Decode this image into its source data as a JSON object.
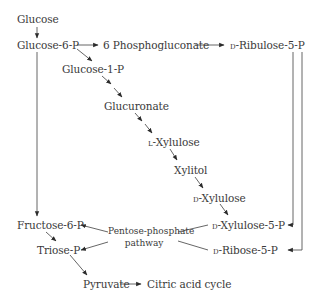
{
  "diagram": {
    "type": "metabolic-pathway",
    "colors": {
      "text": "#3a3a3a",
      "arrow": "#2b2b2b",
      "line": "#555555",
      "background": "#ffffff"
    },
    "nodes": {
      "glucose": "Glucose",
      "glucose_6_p": "Glucose-6-P",
      "phosphogluconate": "6 Phosphogluconate",
      "ribulose_5_p_prefix": "d",
      "ribulose_5_p": "-Ribulose-5-P",
      "glucose_1_p": "Glucose-1-P",
      "glucuronate": "Glucuronate",
      "l_xylulose_prefix": "l",
      "l_xylulose": "-Xylulose",
      "xylitol": "Xylitol",
      "d_xylulose_prefix": "d",
      "d_xylulose": "-Xylulose",
      "fructose_6_p": "Fructose-6-P",
      "xylulose_5_p_prefix": "d",
      "xylulose_5_p": "-Xylulose-5-P",
      "triose_p": "Triose-P",
      "ribose_5_p_prefix": "d",
      "ribose_5_p": "-Ribose-5-P",
      "pyruvate": "Pyruvate",
      "citric_acid_cycle": "Citric acid cycle"
    },
    "hub": {
      "line1": "Pentose-phosphate",
      "line2": "pathway"
    },
    "edges": [
      {
        "from": "Glucose",
        "to": "Glucose-6-P"
      },
      {
        "from": "Glucose-6-P",
        "to": "6 Phosphogluconate"
      },
      {
        "from": "6 Phosphogluconate",
        "to": "D-Ribulose-5-P"
      },
      {
        "from": "Glucose-6-P",
        "to": "Glucose-1-P"
      },
      {
        "from": "Glucose-1-P",
        "to": "Glucuronate"
      },
      {
        "from": "Glucuronate",
        "to": "L-Xylulose"
      },
      {
        "from": "L-Xylulose",
        "to": "Xylitol"
      },
      {
        "from": "Xylitol",
        "to": "D-Xylulose"
      },
      {
        "from": "D-Xylulose",
        "to": "D-Xylulose-5-P"
      },
      {
        "from": "D-Ribulose-5-P",
        "to": "D-Xylulose-5-P"
      },
      {
        "from": "D-Ribulose-5-P",
        "to": "D-Ribose-5-P"
      },
      {
        "from": "Glucose-6-P",
        "to": "Fructose-6-P"
      },
      {
        "from": "Fructose-6-P",
        "to": "Triose-P"
      },
      {
        "from": "Triose-P",
        "to": "Pyruvate"
      },
      {
        "from": "Pyruvate",
        "to": "Citric acid cycle"
      },
      {
        "from": "Pentose-phosphate pathway",
        "to": "Fructose-6-P"
      },
      {
        "from": "Pentose-phosphate pathway",
        "to": "Triose-P"
      },
      {
        "from": "D-Xylulose-5-P",
        "to": "Pentose-phosphate pathway"
      },
      {
        "from": "D-Ribose-5-P",
        "to": "Pentose-phosphate pathway"
      }
    ]
  }
}
